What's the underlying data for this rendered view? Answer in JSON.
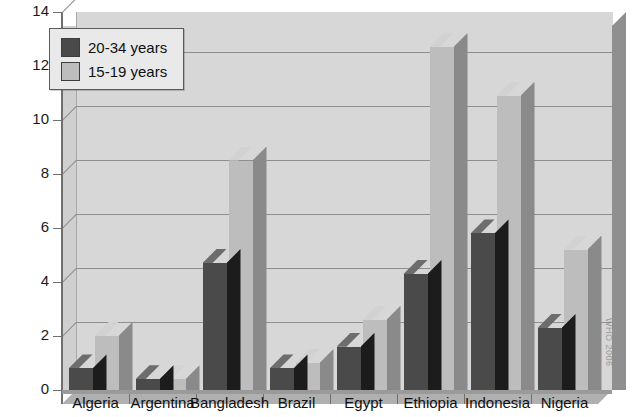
{
  "chart_data": {
    "type": "bar",
    "title": "",
    "title_clipped_glyph": "•",
    "xlabel": "",
    "ylabel": "",
    "categories": [
      "Algeria",
      "Argentina",
      "Bangladesh",
      "Brazil",
      "Egypt",
      "Ethiopia",
      "Indonesia",
      "Nigeria"
    ],
    "series": [
      {
        "name": "20-34 years",
        "color": "#4a4a4a",
        "values": [
          0.8,
          0.4,
          4.7,
          0.8,
          1.6,
          4.3,
          5.8,
          2.3
        ]
      },
      {
        "name": "15-19 years",
        "color": "#bdbdbd",
        "values": [
          2.0,
          0.4,
          8.5,
          1.0,
          2.6,
          12.7,
          10.9,
          5.2
        ]
      }
    ],
    "ylim": [
      0,
      14
    ],
    "yticks": [
      0,
      2,
      4,
      6,
      8,
      10,
      12,
      14
    ],
    "ytick_labels": [
      "0",
      "2",
      "4",
      "6",
      "8",
      "10",
      "12",
      "14"
    ],
    "grid": true,
    "grid_axis": "y",
    "legend_position": "upper-left",
    "style": "3d-column",
    "plot_background": "#d7d7d7"
  },
  "legend": {
    "entries": [
      {
        "label": "20-34 years",
        "swatch": "#4a4a4a"
      },
      {
        "label": "15-19 years",
        "swatch": "#bdbdbd"
      }
    ]
  },
  "watermark": {
    "text": "WHO 2006"
  }
}
